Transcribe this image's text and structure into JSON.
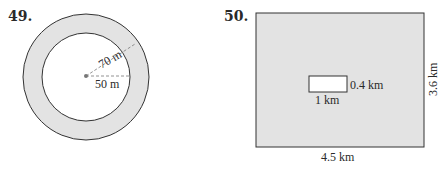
{
  "problems": [
    {
      "number": "49.",
      "figure": "annulus",
      "outer_radius_label": "70 m",
      "inner_radius_label": "50 m",
      "colors": {
        "shaded": "#e3e3e3",
        "inner": "#ffffff",
        "stroke": "#333333"
      }
    },
    {
      "number": "50.",
      "figure": "rectangle-with-hole",
      "outer_width_label": "4.5 km",
      "outer_height_label": "3.6 km",
      "inner_width_label": "1 km",
      "inner_height_label": "0.4 km",
      "colors": {
        "shaded": "#e3e3e3",
        "inner": "#ffffff",
        "stroke": "#333333"
      }
    }
  ]
}
